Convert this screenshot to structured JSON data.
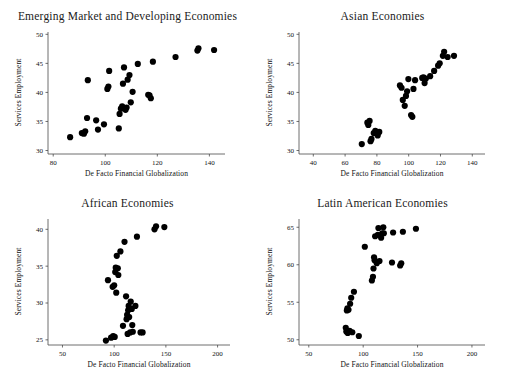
{
  "figure": {
    "panel_count": 4,
    "common_xlabel": "De Facto Financial Globalization",
    "common_ylabel": "Services Employment"
  },
  "chart_data": [
    {
      "type": "scatter",
      "title": "Emerging Market and Developing Economies",
      "xlabel": "De Facto Financial Globalization",
      "ylabel": "Services Employment",
      "xlim": [
        78,
        146
      ],
      "ylim": [
        29.4,
        50.4
      ],
      "xticks": [
        80,
        100,
        120,
        140
      ],
      "yticks": [
        30,
        35,
        40,
        45,
        50
      ],
      "grid": false,
      "legend": "none",
      "points": [
        [
          86.5,
          32.3
        ],
        [
          91.0,
          33.0
        ],
        [
          91.8,
          32.9
        ],
        [
          92.3,
          33.3
        ],
        [
          93.0,
          35.6
        ],
        [
          93.3,
          42.1
        ],
        [
          96.5,
          35.2
        ],
        [
          97.2,
          33.6
        ],
        [
          99.5,
          34.5
        ],
        [
          100.8,
          40.6
        ],
        [
          101.2,
          41.0
        ],
        [
          101.5,
          43.7
        ],
        [
          105.2,
          33.8
        ],
        [
          105.5,
          36.3
        ],
        [
          106.0,
          37.2
        ],
        [
          106.5,
          37.6
        ],
        [
          106.8,
          41.5
        ],
        [
          107.2,
          44.3
        ],
        [
          107.8,
          37.0
        ],
        [
          108.2,
          37.4
        ],
        [
          108.6,
          42.2
        ],
        [
          109.3,
          43.0
        ],
        [
          109.8,
          38.3
        ],
        [
          110.5,
          40.1
        ],
        [
          112.5,
          44.9
        ],
        [
          116.5,
          39.6
        ],
        [
          117.0,
          39.5
        ],
        [
          117.5,
          39.0
        ],
        [
          118.3,
          45.3
        ],
        [
          127.0,
          46.1
        ],
        [
          135.4,
          47.2
        ],
        [
          135.8,
          47.6
        ],
        [
          141.8,
          47.3
        ]
      ]
    },
    {
      "type": "scatter",
      "title": "Asian Economies",
      "xlabel": "De Facto Financial Globalization",
      "ylabel": "Services Employment",
      "xlim": [
        31,
        148
      ],
      "ylim": [
        29.4,
        50.4
      ],
      "xticks": [
        40,
        60,
        80,
        100,
        120,
        140
      ],
      "yticks": [
        30,
        35,
        40,
        45,
        50
      ],
      "grid": false,
      "legend": "none",
      "points": [
        [
          70.5,
          31.1
        ],
        [
          74.0,
          34.8
        ],
        [
          74.6,
          34.4
        ],
        [
          75.4,
          35.1
        ],
        [
          76.0,
          31.6
        ],
        [
          76.6,
          32.0
        ],
        [
          78.0,
          33.0
        ],
        [
          79.0,
          33.4
        ],
        [
          80.5,
          32.6
        ],
        [
          81.5,
          33.2
        ],
        [
          94.5,
          41.2
        ],
        [
          95.5,
          40.8
        ],
        [
          96.3,
          38.7
        ],
        [
          97.5,
          37.7
        ],
        [
          98.3,
          39.4
        ],
        [
          99.0,
          40.2
        ],
        [
          99.8,
          42.3
        ],
        [
          101.5,
          36.1
        ],
        [
          102.3,
          35.8
        ],
        [
          103.0,
          40.6
        ],
        [
          104.0,
          42.1
        ],
        [
          108.5,
          42.5
        ],
        [
          109.3,
          42.6
        ],
        [
          110.0,
          41.6
        ],
        [
          110.8,
          42.4
        ],
        [
          113.5,
          42.8
        ],
        [
          116.0,
          43.7
        ],
        [
          118.5,
          44.6
        ],
        [
          119.5,
          45.0
        ],
        [
          121.5,
          46.3
        ],
        [
          122.3,
          47.0
        ],
        [
          124.5,
          46.1
        ],
        [
          128.5,
          46.3
        ]
      ]
    },
    {
      "type": "scatter",
      "title": "African Economies",
      "xlabel": "De Facto Financial Globalization",
      "ylabel": "Services Employment",
      "xlim": [
        36,
        212
      ],
      "ylim": [
        24.3,
        41.4
      ],
      "xticks": [
        50,
        100,
        150,
        200
      ],
      "yticks": [
        25,
        30,
        35,
        40
      ],
      "grid": false,
      "legend": "none",
      "points": [
        [
          92.0,
          24.9
        ],
        [
          94.0,
          33.1
        ],
        [
          97.0,
          25.3
        ],
        [
          98.5,
          32.2
        ],
        [
          99.0,
          25.5
        ],
        [
          100.0,
          32.4
        ],
        [
          100.5,
          25.4
        ],
        [
          101.0,
          34.2
        ],
        [
          101.5,
          34.8
        ],
        [
          102.0,
          31.4
        ],
        [
          102.5,
          36.4
        ],
        [
          103.5,
          34.7
        ],
        [
          104.0,
          33.8
        ],
        [
          106.0,
          37.0
        ],
        [
          108.5,
          26.9
        ],
        [
          110.0,
          38.3
        ],
        [
          111.5,
          30.9
        ],
        [
          112.0,
          27.8
        ],
        [
          112.5,
          28.4
        ],
        [
          113.0,
          25.8
        ],
        [
          113.5,
          29.0
        ],
        [
          114.0,
          29.6
        ],
        [
          114.5,
          28.1
        ],
        [
          115.5,
          26.0
        ],
        [
          116.0,
          30.2
        ],
        [
          117.0,
          29.2
        ],
        [
          117.5,
          27.0
        ],
        [
          118.0,
          26.1
        ],
        [
          120.5,
          29.6
        ],
        [
          122.0,
          39.0
        ],
        [
          125.5,
          26.0
        ],
        [
          127.5,
          26.0
        ],
        [
          139.0,
          40.0
        ],
        [
          140.5,
          40.4
        ],
        [
          148.5,
          40.3
        ]
      ]
    },
    {
      "type": "scatter",
      "title": "Latin American Economies",
      "xlabel": "De Facto Financial Globalization",
      "ylabel": "Services Employment",
      "xlim": [
        41,
        212
      ],
      "ylim": [
        49.3,
        66.1
      ],
      "xticks": [
        50,
        100,
        150,
        200
      ],
      "yticks": [
        50,
        55,
        60,
        65
      ],
      "grid": false,
      "legend": "none",
      "points": [
        [
          84.0,
          51.6
        ],
        [
          84.5,
          51.1
        ],
        [
          85.0,
          53.9
        ],
        [
          85.5,
          54.2
        ],
        [
          85.8,
          50.9
        ],
        [
          86.5,
          54.0
        ],
        [
          87.5,
          51.2
        ],
        [
          88.0,
          54.8
        ],
        [
          89.0,
          55.6
        ],
        [
          90.0,
          51.0
        ],
        [
          91.5,
          56.4
        ],
        [
          96.0,
          50.5
        ],
        [
          101.5,
          62.4
        ],
        [
          108.0,
          57.9
        ],
        [
          109.0,
          58.4
        ],
        [
          109.5,
          59.5
        ],
        [
          110.0,
          61.0
        ],
        [
          110.5,
          60.6
        ],
        [
          111.0,
          63.8
        ],
        [
          112.5,
          60.2
        ],
        [
          113.5,
          64.0
        ],
        [
          114.0,
          64.9
        ],
        [
          115.0,
          60.5
        ],
        [
          116.5,
          63.6
        ],
        [
          117.5,
          64.2
        ],
        [
          118.5,
          65.0
        ],
        [
          119.0,
          64.2
        ],
        [
          126.5,
          60.3
        ],
        [
          127.5,
          64.3
        ],
        [
          134.0,
          59.9
        ],
        [
          135.0,
          60.2
        ],
        [
          136.5,
          64.4
        ],
        [
          148.5,
          64.8
        ]
      ]
    }
  ]
}
